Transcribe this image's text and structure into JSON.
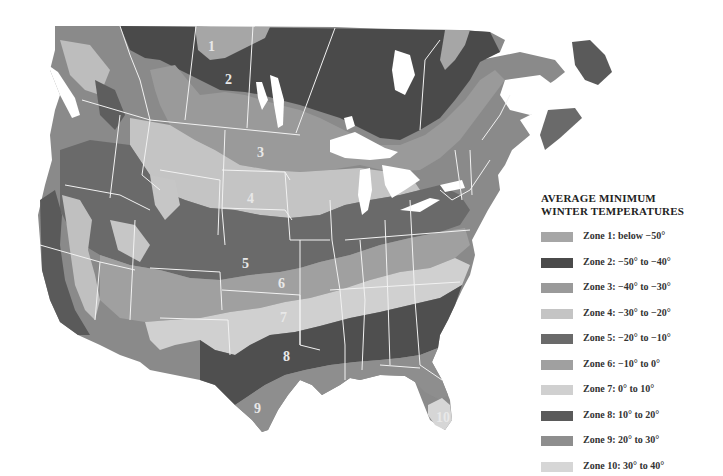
{
  "map": {
    "title": "AVERAGE MINIMUM WINTER TEMPERATURES",
    "title_line1": "AVERAGE MINIMUM",
    "title_line2": "WINTER TEMPERATURES",
    "region": "North America (USA and southern Canada)",
    "zone_labels": [
      {
        "text": "1",
        "x": 212,
        "y": 50
      },
      {
        "text": "2",
        "x": 229,
        "y": 83
      },
      {
        "text": "3",
        "x": 261,
        "y": 155
      },
      {
        "text": "4",
        "x": 251,
        "y": 201
      },
      {
        "text": "5",
        "x": 246,
        "y": 267
      },
      {
        "text": "6",
        "x": 282,
        "y": 286
      },
      {
        "text": "7",
        "x": 284,
        "y": 320
      },
      {
        "text": "8",
        "x": 287,
        "y": 359
      },
      {
        "text": "9",
        "x": 258,
        "y": 411
      },
      {
        "text": "10",
        "x": 442,
        "y": 420
      }
    ]
  },
  "legend": {
    "items": [
      {
        "label": "Zone 1: below −50°",
        "color": "#a6a6a6"
      },
      {
        "label": "Zone 2: −50° to −40°",
        "color": "#4a4a4a"
      },
      {
        "label": "Zone 3: −40° to −30°",
        "color": "#9a9a9a"
      },
      {
        "label": "Zone 4: −30° to −20°",
        "color": "#c4c4c4"
      },
      {
        "label": "Zone 5: −20° to −10°",
        "color": "#6a6a6a"
      },
      {
        "label": "Zone 6: −10° to 0°",
        "color": "#a0a0a0"
      },
      {
        "label": "Zone 7: 0° to 10°",
        "color": "#d0d0d0"
      },
      {
        "label": "Zone 8: 10° to 20°",
        "color": "#5a5a5a"
      },
      {
        "label": "Zone 9: 20° to 30°",
        "color": "#8e8e8e"
      },
      {
        "label": "Zone 10: 30° to 40°",
        "color": "#d6d6d6"
      }
    ]
  }
}
